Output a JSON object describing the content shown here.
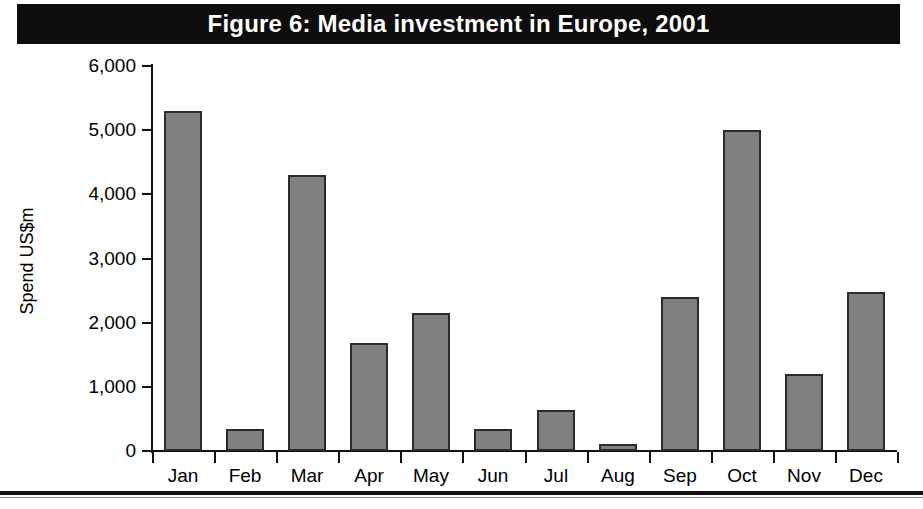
{
  "figure": {
    "title": "Figure 6: Media investment in Europe, 2001",
    "title_background": "#0d0d0d",
    "title_color": "#ffffff"
  },
  "chart_data": {
    "type": "bar",
    "title": "Figure 6: Media investment in Europe, 2001",
    "categories": [
      "Jan",
      "Feb",
      "Mar",
      "Apr",
      "May",
      "Jun",
      "Jul",
      "Aug",
      "Sep",
      "Oct",
      "Nov",
      "Dec"
    ],
    "values": [
      5300,
      340,
      4300,
      1690,
      2150,
      340,
      640,
      110,
      2400,
      5000,
      1200,
      2480
    ],
    "series": [
      {
        "name": "Spend US$m",
        "values": [
          5300,
          340,
          4300,
          1690,
          2150,
          340,
          640,
          110,
          2400,
          5000,
          1200,
          2480
        ]
      }
    ],
    "xlabel": "",
    "ylabel": "Spend US$m",
    "ylim": [
      0,
      6000
    ],
    "ytick_values": [
      0,
      1000,
      2000,
      3000,
      4000,
      5000,
      6000
    ],
    "ytick_labels": [
      "0",
      "1,000",
      "2,000",
      "3,000",
      "4,000",
      "5,000",
      "6,000"
    ],
    "grid": false,
    "legend": false,
    "bar_color": "#808080",
    "bar_edge_color": "#2b2b2b",
    "axis_color": "#111111"
  }
}
